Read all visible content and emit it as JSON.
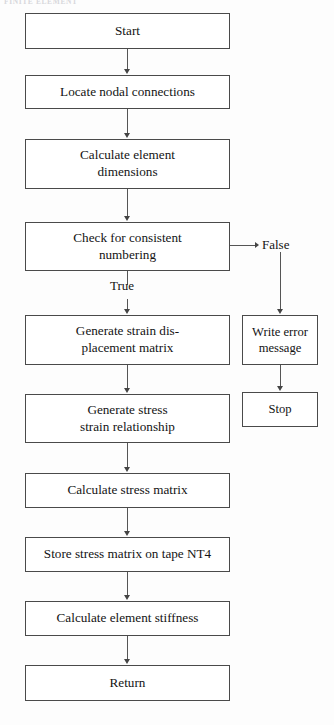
{
  "page": {
    "header_text": "FINITE ELEMENT"
  },
  "diagram": {
    "orientation": "top-to-bottom",
    "stroke_color": "#4a4a4a",
    "background_color": "#ffffff",
    "text_color": "#131313"
  },
  "nodes": [
    {
      "id": "start",
      "label": "Start",
      "lines": [
        "Start"
      ],
      "shape": "rect",
      "column": "main",
      "x": 25,
      "y": 13,
      "w": 205,
      "h": 36
    },
    {
      "id": "locate",
      "label": "Locate nodal connections",
      "lines": [
        "Locate nodal connections"
      ],
      "shape": "rect",
      "column": "main",
      "x": 25,
      "y": 75,
      "w": 205,
      "h": 34
    },
    {
      "id": "calc-dim",
      "label": "Calculate element dimensions",
      "lines": [
        "Calculate element",
        "dimensions"
      ],
      "shape": "rect",
      "column": "main",
      "x": 25,
      "y": 139,
      "w": 205,
      "h": 50
    },
    {
      "id": "check-num",
      "label": "Check for consistent numbering",
      "lines": [
        "Check for consistent",
        "numbering"
      ],
      "shape": "rect",
      "column": "main",
      "x": 25,
      "y": 222,
      "w": 205,
      "h": 49
    },
    {
      "id": "strain-disp",
      "label": "Generate strain displacement matrix",
      "lines": [
        "Generate strain dis-",
        "placement matrix"
      ],
      "shape": "rect",
      "column": "main",
      "x": 25,
      "y": 315,
      "w": 205,
      "h": 50
    },
    {
      "id": "stress-strain",
      "label": "Generate stress strain relationship",
      "lines": [
        "Generate stress",
        "strain relationship"
      ],
      "shape": "rect",
      "column": "main",
      "x": 25,
      "y": 394,
      "w": 205,
      "h": 49
    },
    {
      "id": "calc-stress",
      "label": "Calculate stress matrix",
      "lines": [
        "Calculate stress matrix"
      ],
      "shape": "rect",
      "column": "main",
      "x": 25,
      "y": 473,
      "w": 205,
      "h": 35
    },
    {
      "id": "store-stress",
      "label": "Store stress matrix on tape NT4",
      "lines": [
        "Store stress matrix on tape NT4"
      ],
      "shape": "rect",
      "column": "main",
      "x": 25,
      "y": 537,
      "w": 205,
      "h": 35
    },
    {
      "id": "calc-stiff",
      "label": "Calculate element stiffness",
      "lines": [
        "Calculate element stiffness"
      ],
      "shape": "rect",
      "column": "main",
      "x": 25,
      "y": 601,
      "w": 205,
      "h": 35
    },
    {
      "id": "return",
      "label": "Return",
      "lines": [
        "Return"
      ],
      "shape": "rect",
      "column": "main",
      "x": 25,
      "y": 665,
      "w": 205,
      "h": 36
    },
    {
      "id": "write-error",
      "label": "Write error message",
      "lines": [
        "Write error",
        "message"
      ],
      "shape": "rect",
      "column": "side",
      "x": 242,
      "y": 315,
      "w": 76,
      "h": 50
    },
    {
      "id": "stop",
      "label": "Stop",
      "lines": [
        "Stop"
      ],
      "shape": "rect",
      "column": "side",
      "x": 242,
      "y": 392,
      "w": 76,
      "h": 35
    }
  ],
  "edges": [
    {
      "id": "e-start-locate",
      "from": "start",
      "to": "locate",
      "label": ""
    },
    {
      "id": "e-locate-calcdim",
      "from": "locate",
      "to": "calc-dim",
      "label": ""
    },
    {
      "id": "e-calcdim-checknum",
      "from": "calc-dim",
      "to": "check-num",
      "label": ""
    },
    {
      "id": "e-checknum-straindisp",
      "from": "check-num",
      "to": "strain-disp",
      "label": "True"
    },
    {
      "id": "e-checknum-writeerror",
      "from": "check-num",
      "to": "write-error",
      "label": "False"
    },
    {
      "id": "e-straindisp-stressstrain",
      "from": "strain-disp",
      "to": "stress-strain",
      "label": ""
    },
    {
      "id": "e-stressstrain-calcstress",
      "from": "stress-strain",
      "to": "calc-stress",
      "label": ""
    },
    {
      "id": "e-calcstress-storestress",
      "from": "calc-stress",
      "to": "store-stress",
      "label": ""
    },
    {
      "id": "e-storestress-calcstiff",
      "from": "store-stress",
      "to": "calc-stiff",
      "label": ""
    },
    {
      "id": "e-calcstiff-return",
      "from": "calc-stiff",
      "to": "return",
      "label": ""
    },
    {
      "id": "e-writeerror-stop",
      "from": "write-error",
      "to": "stop",
      "label": ""
    }
  ],
  "edge_labels": {
    "true_label": "True",
    "false_label": "False"
  }
}
